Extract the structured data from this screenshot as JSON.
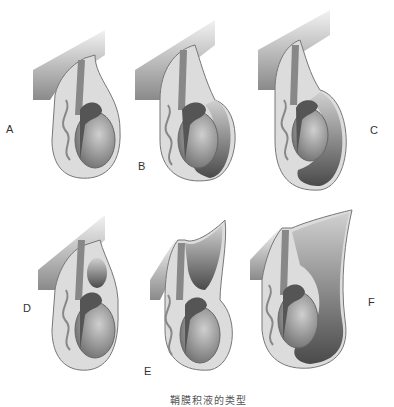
{
  "figure": {
    "panels": [
      {
        "id": "A",
        "label": "A",
        "variant": "normal-tunica-vaginalis"
      },
      {
        "id": "B",
        "label": "B",
        "variant": "testicular-hydrocele"
      },
      {
        "id": "C",
        "label": "C",
        "variant": "large-testicular-hydrocele"
      },
      {
        "id": "D",
        "label": "D",
        "variant": "spermatic-cord-hydrocele"
      },
      {
        "id": "E",
        "label": "E",
        "variant": "communicating-cord-hydrocele"
      },
      {
        "id": "F",
        "label": "F",
        "variant": "communicating-hydrocele"
      }
    ],
    "caption": "鞘膜积液的类型"
  },
  "colors": {
    "abdominal_wall": "#8a8a8a",
    "scrotal_fill": "#d8d8d8",
    "hydrocele_fluid": "#5a5a5a",
    "testis": "#9a9a9a",
    "epididymis": "#555555",
    "outline": "#666666"
  }
}
